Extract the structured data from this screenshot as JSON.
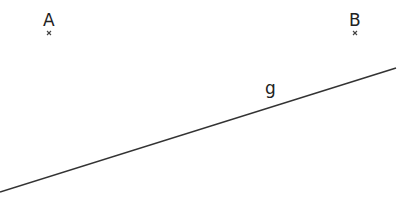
{
  "diagram": {
    "points": [
      {
        "name": "A",
        "x": 49,
        "y": 33
      },
      {
        "name": "B",
        "x": 355,
        "y": 33
      }
    ],
    "lines": [
      {
        "name": "g",
        "x1": 0,
        "y1": 192,
        "x2": 396,
        "y2": 68,
        "color": "#333333"
      }
    ],
    "labels": {
      "point_a": "A",
      "point_b": "B",
      "line_g": "g"
    }
  }
}
